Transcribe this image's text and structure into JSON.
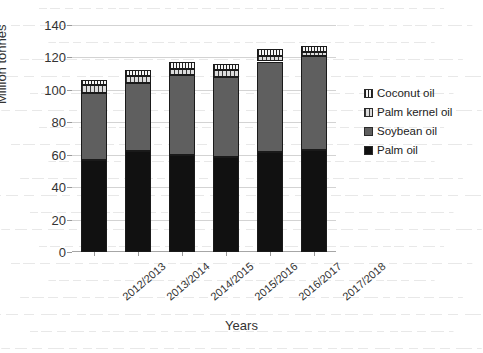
{
  "chart_data": {
    "type": "bar",
    "subtype": "stacked-bar",
    "title": "",
    "xlabel": "Years",
    "ylabel": "Million tonnes",
    "ylim": [
      0,
      140
    ],
    "ytick_step": 20,
    "yticks": [
      "140",
      "120",
      "100",
      "80",
      "60",
      "40",
      "20",
      "0"
    ],
    "grid": true,
    "legend_position": "right",
    "categories": [
      "2012/2013",
      "2013/2014",
      "2014/2015",
      "2015/2016",
      "2016/2017",
      "2017/2018"
    ],
    "series": [
      {
        "name": "Palm oil",
        "color": "#111111",
        "pattern": "solid",
        "values": [
          57.0,
          62.0,
          60.0,
          58.5,
          61.5,
          63.0
        ]
      },
      {
        "name": "Soybean oil",
        "color": "#5f5f5f",
        "pattern": "solid",
        "values": [
          41.0,
          42.0,
          49.0,
          49.5,
          56.0,
          58.0
        ]
      },
      {
        "name": "Palm kernel oil",
        "color": "#d0d0d0",
        "pattern": "vertical-stripes",
        "values": [
          5.0,
          4.5,
          4.0,
          4.0,
          3.5,
          2.5
        ]
      },
      {
        "name": "Coconut oil",
        "color": "#f2f2f2",
        "pattern": "fine-vertical-stripes",
        "values": [
          3.0,
          3.5,
          4.0,
          4.0,
          4.0,
          3.5
        ]
      }
    ],
    "totals": [
      106,
      112,
      117,
      116,
      125,
      127
    ]
  },
  "legend": {
    "items": [
      {
        "label": "Coconut oil"
      },
      {
        "label": "Palm kernel oil"
      },
      {
        "label": "Soybean oil"
      },
      {
        "label": "Palm oil"
      }
    ]
  }
}
